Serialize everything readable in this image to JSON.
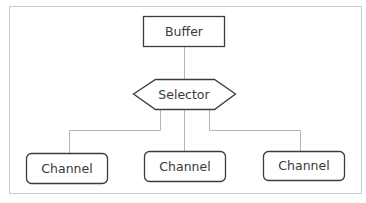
{
  "diagram": {
    "frame_color": "#c8c8c8",
    "line_color": "#b4b4b4",
    "box_stroke": "#3c3c3c",
    "nodes": {
      "buffer": {
        "label": "Buffer",
        "shape": "rectangle"
      },
      "selector": {
        "label": "Selector",
        "shape": "hexagon"
      },
      "channels": [
        {
          "label": "Channel",
          "shape": "rounded-rectangle"
        },
        {
          "label": "Channel",
          "shape": "rounded-rectangle"
        },
        {
          "label": "Channel",
          "shape": "rounded-rectangle"
        }
      ]
    },
    "edges": [
      {
        "from": "Buffer",
        "to": "Selector"
      },
      {
        "from": "Selector",
        "to": "Channel 1"
      },
      {
        "from": "Selector",
        "to": "Channel 2"
      },
      {
        "from": "Selector",
        "to": "Channel 3"
      }
    ]
  }
}
